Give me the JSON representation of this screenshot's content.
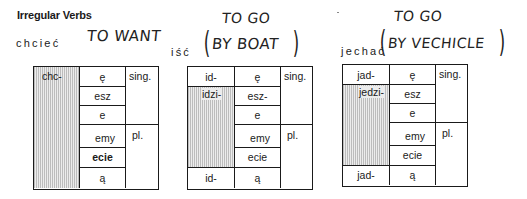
{
  "heading": "Irregular Verbs",
  "tables": [
    {
      "verb": "chcieć",
      "annotation": [
        "TO WANT"
      ],
      "stems": {
        "top": "chc-",
        "middle": "",
        "bottom": ""
      },
      "endings": [
        "ę",
        "esz",
        "e",
        "emy",
        "ecie",
        "ą"
      ],
      "numbers": {
        "singular": "sing.",
        "plural": "pl."
      }
    },
    {
      "verb": "iść",
      "annotation": [
        "TO GO",
        "BY BOAT"
      ],
      "stems": {
        "top": "id-",
        "middle": "idzi-",
        "bottom": "id-"
      },
      "endings": [
        "ę",
        "esz-",
        "e",
        "emy",
        "ecie",
        "ą"
      ],
      "numbers": {
        "singular": "sing.",
        "plural": "pl."
      }
    },
    {
      "verb": "jechać",
      "annotation": [
        "TO GO",
        "BY VECHICLE"
      ],
      "stems": {
        "top": "jad-",
        "middle": "jedzi-",
        "bottom": "jad-"
      },
      "endings": [
        "ę",
        "esz",
        "e",
        "emy",
        "ecie",
        "ą"
      ],
      "numbers": {
        "singular": "sing.",
        "plural": "pl."
      }
    }
  ],
  "paren_open": "(",
  "paren_close": ")"
}
